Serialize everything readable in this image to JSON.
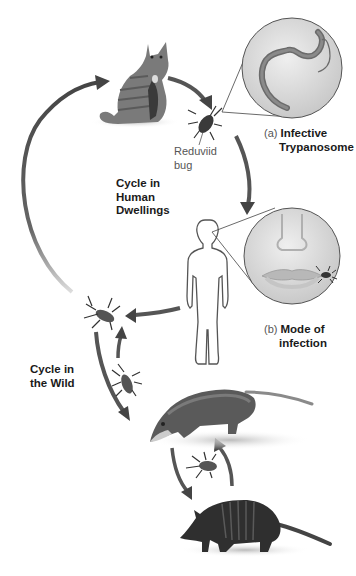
{
  "diagram": {
    "cycles": {
      "human": "Cycle in Human Dwellings",
      "human_lines": [
        "Cycle in",
        "Human",
        "Dwellings"
      ],
      "wild_lines": [
        "Cycle in",
        "the Wild"
      ]
    },
    "labels": {
      "bug": [
        "Reduviid",
        "bug"
      ],
      "a_prefix": "(a)",
      "a_lines": [
        "Infective",
        "Trypanosome"
      ],
      "b_prefix": "(b)",
      "b_lines": [
        "Mode of",
        "infection"
      ]
    },
    "nodes": [
      {
        "id": "cat",
        "name": "Cat (domestic host)"
      },
      {
        "id": "bug-top",
        "name": "Reduviid bug"
      },
      {
        "id": "trypanosome-inset",
        "name": "Infective Trypanosome (magnified)"
      },
      {
        "id": "human",
        "name": "Human"
      },
      {
        "id": "mouth-inset",
        "name": "Mode of infection (bug at lip)"
      },
      {
        "id": "bug-left",
        "name": "Reduviid bug"
      },
      {
        "id": "bug-wild",
        "name": "Reduviid bug"
      },
      {
        "id": "opossum",
        "name": "Opossum"
      },
      {
        "id": "bug-bottom",
        "name": "Reduviid bug"
      },
      {
        "id": "armadillo",
        "name": "Armadillo"
      }
    ],
    "edges": [
      {
        "from": "cat",
        "to": "bug-top"
      },
      {
        "from": "bug-top",
        "to": "human"
      },
      {
        "from": "human",
        "to": "bug-left"
      },
      {
        "from": "bug-left",
        "to": "cat"
      },
      {
        "from": "bug-left",
        "to": "opossum"
      },
      {
        "from": "bug-wild",
        "to": "bug-left"
      },
      {
        "from": "opossum",
        "to": "armadillo"
      },
      {
        "from": "armadillo",
        "to": "opossum"
      }
    ],
    "colors": {
      "arrow": "#555555",
      "inset_bg": "#d9d9d9",
      "animal_dark": "#2f2f2f",
      "animal_mid": "#6a6a6a"
    }
  }
}
